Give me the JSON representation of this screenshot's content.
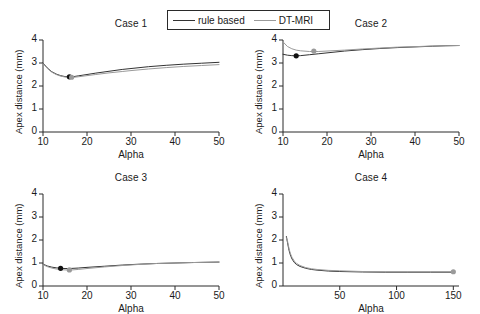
{
  "figure": {
    "background": "#ffffff",
    "width": 480,
    "height": 314,
    "layout": "2x2 subplot grid"
  },
  "legend": {
    "position": "top-center",
    "entries": [
      {
        "label": "rule based",
        "color": "#333333",
        "style": "solid-line"
      },
      {
        "label": "DT-MRI",
        "color": "#9a9a9a",
        "style": "solid-line"
      }
    ]
  },
  "chart_data": [
    {
      "type": "line",
      "title": "Case 1",
      "xlabel": "Alpha",
      "ylabel": "Apex distance (mm)",
      "xlim": [
        10,
        50
      ],
      "ylim": [
        0,
        4
      ],
      "xticks": [
        10,
        20,
        30,
        40,
        50
      ],
      "yticks": [
        0,
        1,
        2,
        3,
        4
      ],
      "grid": false,
      "series": [
        {
          "name": "rule based",
          "color": "#333333",
          "x": [
            10,
            11,
            12,
            13,
            14,
            15,
            16,
            17,
            18,
            20,
            22,
            25,
            28,
            30,
            34,
            38,
            42,
            46,
            50
          ],
          "values": [
            3.0,
            2.78,
            2.62,
            2.52,
            2.45,
            2.41,
            2.4,
            2.41,
            2.44,
            2.5,
            2.56,
            2.64,
            2.72,
            2.76,
            2.84,
            2.9,
            2.95,
            2.99,
            3.03
          ],
          "marker": {
            "x": 16,
            "y": 2.4,
            "color": "#111111"
          }
        },
        {
          "name": "DT-MRI",
          "color": "#9a9a9a",
          "x": [
            10,
            11,
            12,
            13,
            14,
            15,
            16,
            17,
            18,
            20,
            22,
            25,
            28,
            30,
            34,
            38,
            42,
            46,
            50
          ],
          "values": [
            2.98,
            2.76,
            2.6,
            2.5,
            2.43,
            2.39,
            2.38,
            2.38,
            2.4,
            2.45,
            2.5,
            2.57,
            2.63,
            2.67,
            2.74,
            2.8,
            2.85,
            2.89,
            2.93
          ],
          "marker": {
            "x": 16.5,
            "y": 2.38,
            "color": "#9a9a9a"
          }
        }
      ]
    },
    {
      "type": "line",
      "title": "Case 2",
      "xlabel": "Alpha",
      "ylabel": "Apex distance (mm)",
      "xlim": [
        10,
        50
      ],
      "ylim": [
        0,
        4
      ],
      "xticks": [
        10,
        20,
        30,
        40,
        50
      ],
      "yticks": [
        0,
        1,
        2,
        3,
        4
      ],
      "grid": false,
      "series": [
        {
          "name": "rule based",
          "color": "#333333",
          "x": [
            10,
            11,
            12,
            13,
            14,
            16,
            18,
            20,
            24,
            28,
            32,
            36,
            40,
            44,
            47,
            50
          ],
          "values": [
            3.38,
            3.34,
            3.32,
            3.31,
            3.32,
            3.36,
            3.4,
            3.44,
            3.52,
            3.58,
            3.63,
            3.67,
            3.7,
            3.73,
            3.75,
            3.76
          ],
          "marker": {
            "x": 13,
            "y": 3.31,
            "color": "#111111"
          }
        },
        {
          "name": "DT-MRI",
          "color": "#9a9a9a",
          "x": [
            10,
            11,
            12,
            13,
            14,
            16,
            18,
            20,
            24,
            28,
            32,
            36,
            40,
            44,
            47,
            50
          ],
          "values": [
            3.92,
            3.72,
            3.62,
            3.56,
            3.53,
            3.5,
            3.5,
            3.52,
            3.56,
            3.61,
            3.65,
            3.69,
            3.71,
            3.74,
            3.75,
            3.76
          ],
          "marker": {
            "x": 17,
            "y": 3.52,
            "color": "#9a9a9a"
          }
        }
      ]
    },
    {
      "type": "line",
      "title": "Case 3",
      "xlabel": "Alpha",
      "ylabel": "Apex distance (mm)",
      "xlim": [
        10,
        50
      ],
      "ylim": [
        0,
        4
      ],
      "xticks": [
        10,
        20,
        30,
        40,
        50
      ],
      "yticks": [
        0,
        1,
        2,
        3,
        4
      ],
      "grid": false,
      "series": [
        {
          "name": "rule based",
          "color": "#333333",
          "x": [
            10,
            11,
            12,
            13,
            14,
            15,
            16,
            18,
            20,
            24,
            28,
            32,
            36,
            40,
            44,
            47,
            50
          ],
          "values": [
            0.95,
            0.87,
            0.82,
            0.79,
            0.77,
            0.76,
            0.76,
            0.78,
            0.81,
            0.86,
            0.91,
            0.95,
            0.98,
            1.0,
            1.02,
            1.03,
            1.04
          ],
          "marker": {
            "x": 14,
            "y": 0.77,
            "color": "#111111"
          }
        },
        {
          "name": "DT-MRI",
          "color": "#9a9a9a",
          "x": [
            10,
            11,
            12,
            13,
            14,
            15,
            16,
            18,
            20,
            24,
            28,
            32,
            36,
            40,
            44,
            47,
            50
          ],
          "values": [
            0.93,
            0.84,
            0.78,
            0.74,
            0.71,
            0.7,
            0.69,
            0.72,
            0.76,
            0.83,
            0.89,
            0.94,
            0.98,
            1.0,
            1.02,
            1.03,
            1.04
          ],
          "marker": {
            "x": 16,
            "y": 0.7,
            "color": "#9a9a9a"
          }
        }
      ]
    },
    {
      "type": "line",
      "title": "Case 4",
      "xlabel": "Alpha",
      "ylabel": "Apex distance (mm)",
      "xlim": [
        0,
        155
      ],
      "ylim": [
        0,
        4
      ],
      "xticks": [
        50,
        100,
        150
      ],
      "yticks": [
        0,
        1,
        2,
        3,
        4
      ],
      "grid": false,
      "series": [
        {
          "name": "rule based",
          "color": "#333333",
          "x": [
            3,
            4,
            5,
            6,
            7,
            8,
            10,
            12,
            15,
            20,
            25,
            30,
            40,
            50,
            70,
            90,
            110,
            130,
            150
          ],
          "values": [
            2.15,
            1.88,
            1.62,
            1.42,
            1.28,
            1.17,
            1.02,
            0.93,
            0.85,
            0.77,
            0.72,
            0.69,
            0.65,
            0.63,
            0.61,
            0.6,
            0.6,
            0.6,
            0.6
          ],
          "marker": null
        },
        {
          "name": "DT-MRI",
          "color": "#9a9a9a",
          "x": [
            3,
            4,
            5,
            6,
            7,
            8,
            10,
            12,
            15,
            20,
            25,
            30,
            40,
            50,
            70,
            90,
            110,
            130,
            150
          ],
          "values": [
            2.1,
            1.95,
            1.7,
            1.5,
            1.35,
            1.24,
            1.08,
            0.98,
            0.89,
            0.8,
            0.75,
            0.72,
            0.68,
            0.66,
            0.63,
            0.62,
            0.62,
            0.62,
            0.62
          ],
          "marker": {
            "x": 150,
            "y": 0.62,
            "color": "#9a9a9a"
          }
        }
      ]
    }
  ]
}
